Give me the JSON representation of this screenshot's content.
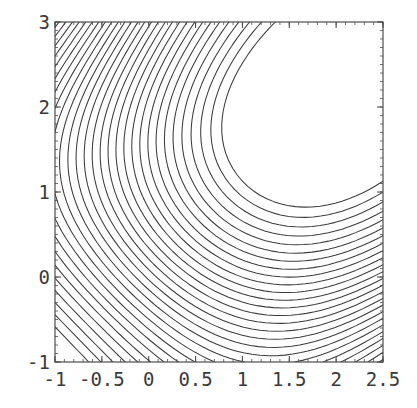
{
  "chart_data": {
    "type": "line",
    "plot_kind": "contour",
    "title": "",
    "subtitle": "",
    "xlabel": "",
    "ylabel": "",
    "xlim": [
      -1,
      2.5
    ],
    "ylim": [
      -1,
      3
    ],
    "grid": false,
    "legend": null,
    "legend_position": "none",
    "frame": true,
    "frame_color": "#4d4d4d",
    "contour_line_color": "#3c3c3c",
    "background_color": "#ffffff",
    "shaded": false,
    "xticks": [
      -1,
      -0.5,
      0,
      0.5,
      1,
      1.5,
      2,
      2.5
    ],
    "xtick_labels": [
      "-1",
      "-0.5",
      "0",
      "0.5",
      "1",
      "1.5",
      "2",
      "2.5"
    ],
    "yticks": [
      -1,
      0,
      1,
      2,
      3
    ],
    "ytick_labels": [
      "-1",
      "0",
      "1",
      "2",
      "3"
    ],
    "x_minor_tick_step": 0.1,
    "y_minor_tick_step": 0.1,
    "n_contour_levels": 30,
    "features": {
      "local_maximum": {
        "x": 1.7,
        "y": 2.05,
        "note": "nested closed contours, innermost small polygon"
      },
      "saddle_point": {
        "x": 0.0,
        "y": -0.15,
        "note": "contours cross in X pattern near lower-left-center"
      },
      "dense_region_upper_left": "parallel diagonal contours running lower-left to upper-right",
      "dense_region_lower_right": "parallel diagonal contours curving toward bottom-right corner",
      "valley_center": {
        "x": 0.3,
        "y": 0.5,
        "note": "broad open low region left of centre"
      }
    },
    "surface_model": {
      "description": "f(x,y) = sin(x) + sin(y) + 0.30*x*y - 0.50*(x-1.7)^2*0.20 type blend reproducing one interior peak near (1.7,2.05) and a saddle near (0,-0.15)",
      "levels_min": -3.2,
      "levels_max": 2.05,
      "level_step": 0.18
    },
    "sampled_levels": [
      -3.2,
      -3.02,
      -2.84,
      -2.66,
      -2.48,
      -2.3,
      -2.12,
      -1.94,
      -1.76,
      -1.58,
      -1.4,
      -1.22,
      -1.04,
      -0.86,
      -0.68,
      -0.5,
      -0.32,
      -0.14,
      0.04,
      0.22,
      0.4,
      0.58,
      0.76,
      0.94,
      1.12,
      1.3,
      1.48,
      1.66,
      1.84,
      2.02
    ]
  },
  "geometry": {
    "canvas_width": 417,
    "canvas_height": 408,
    "plot_left": 55,
    "plot_top": 22,
    "plot_right": 383,
    "plot_bottom": 362
  }
}
